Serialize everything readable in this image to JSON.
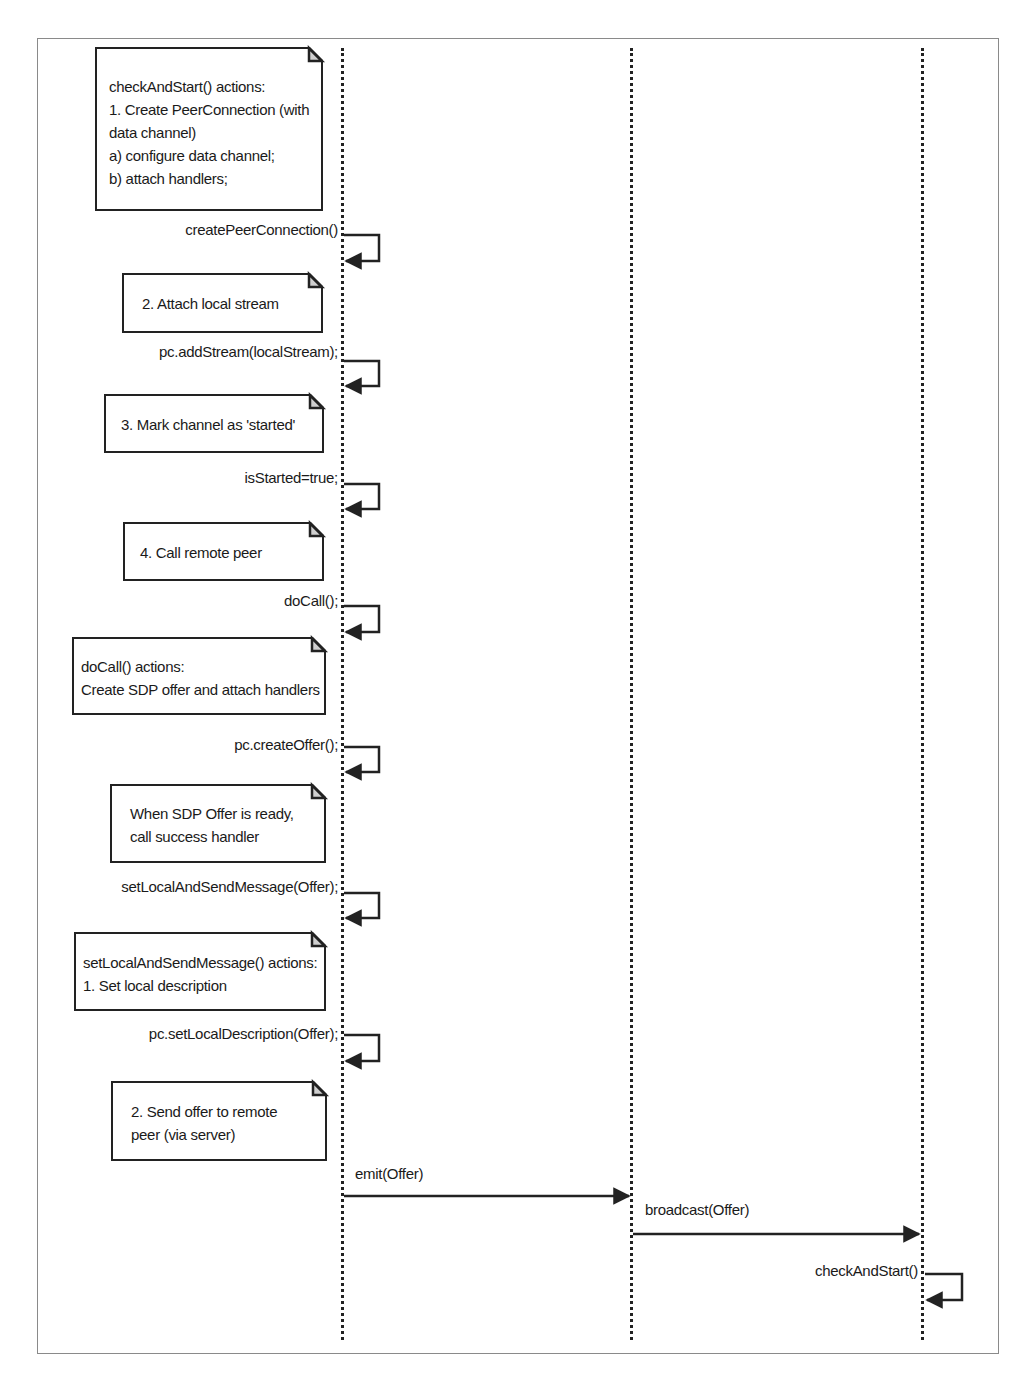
{
  "diagram": {
    "type": "sequence",
    "lifelines": [
      {
        "id": "caller",
        "x": 342
      },
      {
        "id": "server",
        "x": 631
      },
      {
        "id": "callee",
        "x": 922
      }
    ],
    "notes": [
      {
        "id": "note-checkandstart-actions",
        "lines": [
          "checkAndStart() actions:",
          "1. Create PeerConnection (with",
          "data channel)",
          "a) configure data channel;",
          "b) attach handlers;"
        ]
      },
      {
        "id": "note-attach-local-stream",
        "lines": [
          "2. Attach local stream"
        ]
      },
      {
        "id": "note-mark-started",
        "lines": [
          "3. Mark channel as 'started'"
        ]
      },
      {
        "id": "note-call-remote-peer",
        "lines": [
          "4. Call remote peer"
        ]
      },
      {
        "id": "note-docall-actions",
        "lines": [
          "doCall() actions:",
          "Create SDP offer and attach handlers"
        ]
      },
      {
        "id": "note-sdp-offer-ready",
        "lines": [
          "When SDP Offer is ready,",
          "call success handler"
        ]
      },
      {
        "id": "note-setlocal-actions",
        "lines": [
          "setLocalAndSendMessage() actions:",
          "1. Set local description"
        ]
      },
      {
        "id": "note-send-offer",
        "lines": [
          "2. Send offer to remote",
          "peer (via server)"
        ]
      }
    ],
    "messages": [
      {
        "label": "createPeerConnection()",
        "from": "caller",
        "to": "caller"
      },
      {
        "label": "pc.addStream(localStream);",
        "from": "caller",
        "to": "caller"
      },
      {
        "label": "isStarted=true;",
        "from": "caller",
        "to": "caller"
      },
      {
        "label": "doCall();",
        "from": "caller",
        "to": "caller"
      },
      {
        "label": "pc.createOffer();",
        "from": "caller",
        "to": "caller"
      },
      {
        "label": "setLocalAndSendMessage(Offer);",
        "from": "caller",
        "to": "caller"
      },
      {
        "label": "pc.setLocalDescription(Offer);",
        "from": "caller",
        "to": "caller"
      },
      {
        "label": "emit(Offer)",
        "from": "caller",
        "to": "server"
      },
      {
        "label": "broadcast(Offer)",
        "from": "server",
        "to": "callee"
      },
      {
        "label": "checkAndStart()",
        "from": "callee",
        "to": "callee"
      }
    ]
  },
  "colors": {
    "line": "#222222",
    "frame": "#8a8a8a",
    "fold": "#cfcfcf",
    "background": "#ffffff"
  }
}
